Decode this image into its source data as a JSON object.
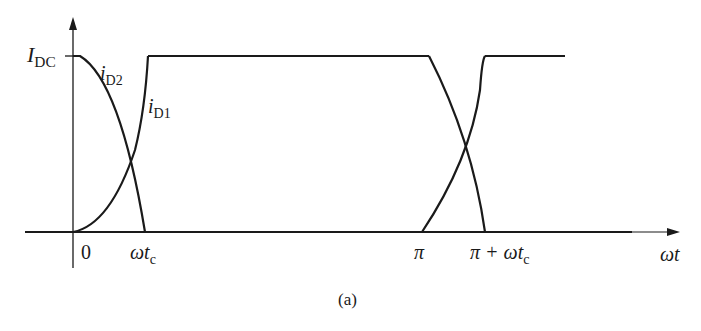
{
  "figure": {
    "caption": "(a)",
    "y_axis_label": {
      "main": "I",
      "sub": "DC"
    },
    "x_axis_label": "ωt",
    "curves": [
      {
        "name": "i",
        "sub": "D2"
      },
      {
        "name": "i",
        "sub": "D1"
      }
    ],
    "ticks": [
      "0",
      "ωt",
      "c",
      "π",
      "π + ωt",
      "c"
    ]
  },
  "labels": {
    "idc_main": "I",
    "idc_sub": "DC",
    "id2_main": "i",
    "id2_sub": "D2",
    "id1_main": "i",
    "id1_sub": "D1",
    "zero": "0",
    "wtc_main": "ωt",
    "wtc_sub": "c",
    "pi": "π",
    "piwtc_main": "π + ωt",
    "piwtc_sub": "c",
    "wt": "ωt",
    "caption": "(a)"
  }
}
